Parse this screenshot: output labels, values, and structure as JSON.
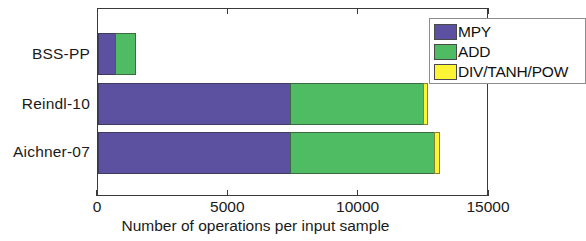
{
  "chart_data": {
    "type": "bar",
    "orientation": "horizontal",
    "stacked": true,
    "title": "",
    "xlabel": "Number of operations per input sample",
    "ylabel": "",
    "categories": [
      "Aichner-07",
      "Reindl-10",
      "BSS-PP"
    ],
    "series": [
      {
        "name": "MPY",
        "color": "#5b51a0",
        "values": [
          7400,
          7400,
          690
        ]
      },
      {
        "name": "ADD",
        "color": "#4fbb63",
        "values": [
          5560,
          5140,
          800
        ]
      },
      {
        "name": "DIV/TANH/POW",
        "color": "#fcf434",
        "values": [
          230,
          190,
          0
        ]
      }
    ],
    "totals": [
      13190,
      12730,
      1490
    ],
    "xlim": [
      0,
      15000
    ],
    "xticks": [
      0,
      5000,
      10000,
      15000
    ],
    "xtick_labels": [
      "0",
      "5000",
      "10000",
      "15000"
    ],
    "grid": false,
    "legend_position": "top-right",
    "legend_entries": [
      "MPY",
      "ADD",
      "DIV/TANH/POW"
    ]
  },
  "axis": {
    "x_title": "Number of operations per input sample",
    "ticks": [
      {
        "label": "0",
        "value": 0
      },
      {
        "label": "5000",
        "value": 5000
      },
      {
        "label": "10000",
        "value": 10000
      },
      {
        "label": "15000",
        "value": 15000
      }
    ],
    "y_labels": {
      "bss": "BSS-PP",
      "reindl": "Reindl-10",
      "aichner": "Aichner-07"
    }
  },
  "legend": {
    "items": [
      {
        "label": "MPY",
        "color": "#5b51a0"
      },
      {
        "label": "ADD",
        "color": "#4fbb63"
      },
      {
        "label": "DIV/TANH/POW",
        "color": "#fcf434"
      }
    ]
  },
  "colors": {
    "mpy": "#5b51a0",
    "add": "#4fbb63",
    "div_tanh_pow": "#fcf434",
    "axis": "#3a3a3a",
    "text": "#1a1a1a",
    "background": "#ffffff"
  }
}
